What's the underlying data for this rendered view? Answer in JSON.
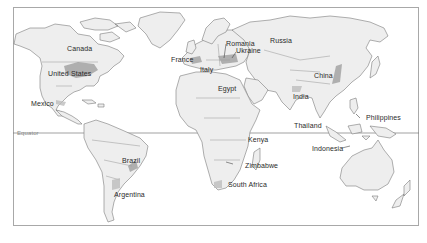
{
  "map": {
    "type": "world-political-outline",
    "equator_label": "Equator",
    "highlight_color": "#9a9a9a",
    "land_color": "#eeeeee",
    "border_color": "#7a7a7a",
    "labels": {
      "canada": "Canada",
      "united_states": "United States",
      "mexico": "Mexico",
      "brazil": "Brazil",
      "argentina": "Argentina",
      "france": "France",
      "italy": "Italy",
      "romania": "Romania",
      "ukraine": "Ukraine",
      "russia": "Russia",
      "egypt": "Egypt",
      "kenya": "Kenya",
      "zimbabwe": "Zimbabwe",
      "south_africa": "South Africa",
      "india": "India",
      "china": "China",
      "thailand": "Thailand",
      "philippines": "Philippines",
      "indonesia": "Indonesia"
    }
  }
}
